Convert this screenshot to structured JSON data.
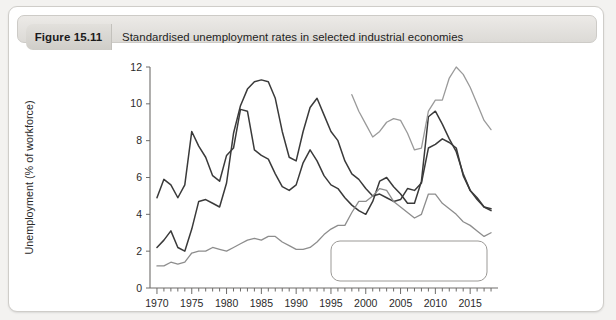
{
  "figure": {
    "label": "Figure 15.11",
    "title": "Standardised unemployment rates in selected industrial economies"
  },
  "chart_data": {
    "type": "line",
    "title": "Standardised unemployment rates in selected industrial economies",
    "xlabel": "",
    "ylabel": "Unemployment (% of workforce)",
    "xlim": [
      1969,
      2019
    ],
    "ylim": [
      0,
      12
    ],
    "ytick_labels": [
      "0",
      "2",
      "4",
      "6",
      "8",
      "10",
      "12"
    ],
    "yticks": [
      0,
      2,
      4,
      6,
      8,
      10,
      12
    ],
    "xtick_labels": [
      "1970",
      "1975",
      "1980",
      "1985",
      "1990",
      "1995",
      "2000",
      "2005",
      "2010",
      "2015"
    ],
    "xticks": [
      1970,
      1975,
      1980,
      1985,
      1990,
      1995,
      2000,
      2005,
      2010,
      2015
    ],
    "minor_xtick_interval": 1,
    "grid": false,
    "legend_position": "lower-right-inside",
    "colors": {
      "uk": "#3a3a3a",
      "usa": "#3a3a3a",
      "eurozone": "#9a9a9a",
      "japan": "#8d8d8d"
    },
    "series": [
      {
        "name": "UK",
        "color": "#3a3a3a",
        "x": [
          1970,
          1971,
          1972,
          1973,
          1974,
          1975,
          1976,
          1977,
          1978,
          1979,
          1980,
          1981,
          1982,
          1983,
          1984,
          1985,
          1986,
          1987,
          1988,
          1989,
          1990,
          1991,
          1992,
          1993,
          1994,
          1995,
          1996,
          1997,
          1998,
          1999,
          2000,
          2001,
          2002,
          2003,
          2004,
          2005,
          2006,
          2007,
          2008,
          2009,
          2010,
          2011,
          2012,
          2013,
          2014,
          2015,
          2016,
          2017,
          2018
        ],
        "values": [
          2.2,
          2.6,
          3.1,
          2.2,
          2.0,
          3.2,
          4.7,
          4.8,
          4.6,
          4.4,
          5.7,
          8.4,
          9.9,
          10.8,
          11.2,
          11.3,
          11.2,
          10.3,
          8.5,
          7.1,
          6.9,
          8.5,
          9.8,
          10.3,
          9.4,
          8.5,
          8.0,
          6.9,
          6.2,
          5.9,
          5.4,
          5.0,
          5.1,
          4.9,
          4.7,
          4.8,
          5.4,
          5.3,
          5.7,
          7.6,
          7.8,
          8.1,
          7.9,
          7.6,
          6.1,
          5.3,
          4.8,
          4.4,
          4.3
        ]
      },
      {
        "name": "USA",
        "color": "#3a3a3a",
        "x": [
          1970,
          1971,
          1972,
          1973,
          1974,
          1975,
          1976,
          1977,
          1978,
          1979,
          1980,
          1981,
          1982,
          1983,
          1984,
          1985,
          1986,
          1987,
          1988,
          1989,
          1990,
          1991,
          1992,
          1993,
          1994,
          1995,
          1996,
          1997,
          1998,
          1999,
          2000,
          2001,
          2002,
          2003,
          2004,
          2005,
          2006,
          2007,
          2008,
          2009,
          2010,
          2011,
          2012,
          2013,
          2014,
          2015,
          2016,
          2017,
          2018
        ],
        "values": [
          4.9,
          5.9,
          5.6,
          4.9,
          5.6,
          8.5,
          7.7,
          7.1,
          6.1,
          5.8,
          7.2,
          7.6,
          9.7,
          9.6,
          7.5,
          7.2,
          7.0,
          6.2,
          5.5,
          5.3,
          5.6,
          6.8,
          7.5,
          6.9,
          6.1,
          5.6,
          5.4,
          4.9,
          4.5,
          4.2,
          4.0,
          4.7,
          5.8,
          6.0,
          5.5,
          5.1,
          4.6,
          4.6,
          5.8,
          9.3,
          9.6,
          8.9,
          8.1,
          7.4,
          6.2,
          5.3,
          4.9,
          4.4,
          4.2
        ]
      },
      {
        "name": "Eurozone",
        "color": "#9a9a9a",
        "x": [
          1998,
          1999,
          2000,
          2001,
          2002,
          2003,
          2004,
          2005,
          2006,
          2007,
          2008,
          2009,
          2010,
          2011,
          2012,
          2013,
          2014,
          2015,
          2016,
          2017,
          2018
        ],
        "values": [
          10.5,
          9.6,
          8.9,
          8.2,
          8.5,
          9.0,
          9.2,
          9.1,
          8.4,
          7.5,
          7.6,
          9.6,
          10.2,
          10.2,
          11.4,
          12.0,
          11.6,
          10.9,
          10.0,
          9.1,
          8.6
        ]
      },
      {
        "name": "Japan",
        "color": "#8d8d8d",
        "x": [
          1970,
          1971,
          1972,
          1973,
          1974,
          1975,
          1976,
          1977,
          1978,
          1979,
          1980,
          1981,
          1982,
          1983,
          1984,
          1985,
          1986,
          1987,
          1988,
          1989,
          1990,
          1991,
          1992,
          1993,
          1994,
          1995,
          1996,
          1997,
          1998,
          1999,
          2000,
          2001,
          2002,
          2003,
          2004,
          2005,
          2006,
          2007,
          2008,
          2009,
          2010,
          2011,
          2012,
          2013,
          2014,
          2015,
          2016,
          2017,
          2018
        ],
        "values": [
          1.2,
          1.2,
          1.4,
          1.3,
          1.4,
          1.9,
          2.0,
          2.0,
          2.2,
          2.1,
          2.0,
          2.2,
          2.4,
          2.6,
          2.7,
          2.6,
          2.8,
          2.8,
          2.5,
          2.3,
          2.1,
          2.1,
          2.2,
          2.5,
          2.9,
          3.2,
          3.4,
          3.4,
          4.1,
          4.7,
          4.7,
          5.0,
          5.4,
          5.3,
          4.7,
          4.4,
          4.1,
          3.8,
          4.0,
          5.1,
          5.1,
          4.6,
          4.3,
          4.0,
          3.6,
          3.4,
          3.1,
          2.8,
          3.0
        ]
      }
    ]
  },
  "legend": {
    "entries": [
      {
        "label": "UK",
        "color": "#3a3a3a"
      },
      {
        "label": "USA",
        "color": "#3a3a3a"
      },
      {
        "label": "Eurozone",
        "color": "#9a9a9a"
      },
      {
        "label": "Japan",
        "color": "#8d8d8d"
      }
    ]
  }
}
